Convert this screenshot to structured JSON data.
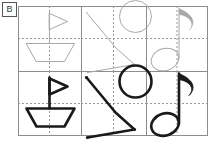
{
  "panel": {
    "label": "B",
    "width": 213,
    "height": 143
  },
  "figure": {
    "type": "shape-matrix",
    "rows": 2,
    "cols": 3,
    "row_labels": [
      "faint",
      "bold"
    ],
    "grid": {
      "left": 18,
      "top": 6,
      "right": 208,
      "bottom": 136,
      "col_dividers": [
        81,
        146
      ],
      "row_divider": 71,
      "border_color": "#8c8c8c",
      "border_width": 1,
      "guide_color": "#9a9a9a",
      "guide_dash": "2,2"
    },
    "styles": {
      "faint_color": "#a8a8a8",
      "faint_width": 1,
      "bold_color": "#1a1a1a",
      "bold_width": 2.6
    },
    "cells": [
      {
        "row": 0,
        "col": 0,
        "name": "sailboat",
        "style": "faint",
        "center": [
          49.5,
          38.5
        ],
        "guides": {
          "vertical": 49.5,
          "horizontal": 38.5
        }
      },
      {
        "row": 0,
        "col": 1,
        "name": "zigzag-circle",
        "style": "faint",
        "center": [
          113.5,
          38.5
        ],
        "guides": {
          "vertical": 113.5,
          "horizontal": 38.5
        }
      },
      {
        "row": 0,
        "col": 2,
        "name": "eighth-note",
        "style": "faint",
        "center": [
          177,
          38.5
        ],
        "guides": {
          "vertical": 177,
          "horizontal": 38.5
        }
      },
      {
        "row": 1,
        "col": 0,
        "name": "sailboat",
        "style": "bold",
        "center": [
          49.5,
          103.5
        ],
        "guides": {
          "vertical": 49.5,
          "horizontal": 103.5
        }
      },
      {
        "row": 1,
        "col": 1,
        "name": "zigzag-circle",
        "style": "bold",
        "center": [
          113.5,
          103.5
        ],
        "guides": {
          "vertical": 113.5,
          "horizontal": 103.5
        }
      },
      {
        "row": 1,
        "col": 2,
        "name": "eighth-note",
        "style": "bold",
        "center": [
          177,
          103.5
        ],
        "guides": {
          "vertical": 177,
          "horizontal": 103.5
        }
      }
    ],
    "shape_defs": {
      "sailboat": {
        "description": "triangular sail on vertical mast above trapezoid hull",
        "mast": [
          [
            0,
            -26
          ],
          [
            0,
            5
          ]
        ],
        "sail": [
          [
            0,
            -25
          ],
          [
            18,
            -17
          ],
          [
            0,
            -9
          ]
        ],
        "hull": [
          [
            -23,
            5
          ],
          [
            25,
            5
          ],
          [
            15,
            23
          ],
          [
            -13,
            23
          ]
        ]
      },
      "zigzag-circle": {
        "description": "open zigzag polyline with endpoint dots plus a circle",
        "polyline": [
          [
            -27,
            -26
          ],
          [
            2,
            9
          ],
          [
            21,
            26
          ],
          [
            -26,
            34
          ]
        ],
        "dots": [
          [
            -27,
            -26
          ],
          [
            21,
            26
          ],
          [
            -26,
            34
          ]
        ],
        "circle": {
          "cx": 22,
          "cy": -22,
          "r": 16
        }
      },
      "eighth-note": {
        "description": "oval notehead with vertical stem and curved flag",
        "notehead": {
          "cx": -12,
          "cy": 21,
          "rx": 14,
          "ry": 11,
          "rotate": -18
        },
        "stem": [
          [
            2,
            20
          ],
          [
            2,
            -30
          ]
        ],
        "flag": "M 2 -30 C 16 -24 20 -16 12 -8 C 18 -14 14 -22 2 -24"
      }
    }
  }
}
